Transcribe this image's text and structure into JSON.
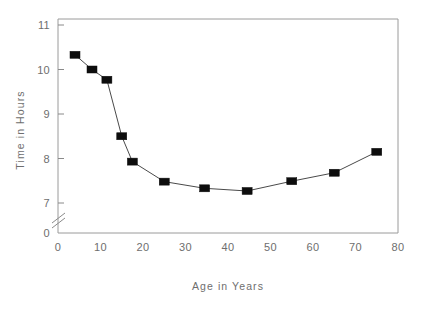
{
  "chart_data": {
    "type": "line",
    "title": "",
    "subtitle": "",
    "xlabel": "Age in Years",
    "ylabel": "Time in Hours",
    "xlim": [
      0,
      80
    ],
    "ylim": [
      7,
      11
    ],
    "grid": false,
    "legend": null,
    "axis_break": {
      "axis": "y",
      "between": [
        0,
        7
      ],
      "style": "double-slash"
    },
    "xticks": [
      0,
      10,
      20,
      30,
      40,
      50,
      60,
      70,
      80
    ],
    "xticklabels": [
      "0",
      "10",
      "20",
      "30",
      "40",
      "50",
      "60",
      "70",
      "80"
    ],
    "yticks": [
      0,
      7,
      8,
      9,
      10,
      11
    ],
    "yticklabels": [
      "0",
      "7",
      "8",
      "9",
      "10",
      "11"
    ],
    "marker": "square",
    "marker_color": "#0d0d0d",
    "line_color": "#4a4a4a",
    "x": [
      4,
      8,
      11.5,
      15,
      17.5,
      25,
      34.5,
      44.5,
      55,
      65,
      75
    ],
    "values": [
      10.33,
      10.0,
      9.77,
      8.5,
      7.93,
      7.48,
      7.33,
      7.27,
      7.49,
      7.68,
      8.15
    ],
    "points": [
      {
        "x": 4,
        "y": 10.33
      },
      {
        "x": 8,
        "y": 10.0
      },
      {
        "x": 11.5,
        "y": 9.77
      },
      {
        "x": 15,
        "y": 8.5
      },
      {
        "x": 17.5,
        "y": 7.93
      },
      {
        "x": 25,
        "y": 7.48
      },
      {
        "x": 34.5,
        "y": 7.33
      },
      {
        "x": 44.5,
        "y": 7.27
      },
      {
        "x": 55,
        "y": 7.49
      },
      {
        "x": 65,
        "y": 7.68
      },
      {
        "x": 75,
        "y": 8.15
      }
    ]
  },
  "axes": {
    "x_title": "Age in Years",
    "y_title": "Time in Hours"
  },
  "colors": {
    "background": "#ffffff",
    "axis": "#8a8a8a",
    "frame": "#9a9a9a",
    "text": "#6e6e6e",
    "marker": "#0d0d0d",
    "line": "#4a4a4a"
  }
}
